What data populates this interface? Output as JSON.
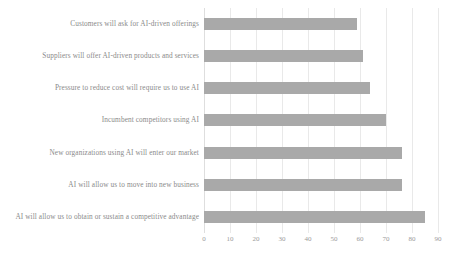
{
  "chart_data": {
    "type": "bar",
    "orientation": "horizontal",
    "title": "",
    "xlabel": "",
    "ylabel": "",
    "xlim": [
      0,
      90
    ],
    "grid": true,
    "legend": "none",
    "bar_color": "#a9a9a9",
    "background_color": "#ffffff",
    "xticks": [
      "0",
      "10",
      "20",
      "30",
      "40",
      "50",
      "60",
      "70",
      "80",
      "90"
    ],
    "xtick_values": [
      0,
      10,
      20,
      30,
      40,
      50,
      60,
      70,
      80,
      90
    ],
    "categories": [
      "Customers will ask for AI-driven offerings",
      "Suppliers will offer AI-driven products and services",
      "Pressure to reduce cost will require us to use AI",
      "Incumbent competitors using AI",
      "New organizations using AI will enter our market",
      "AI will allow us to move into new business",
      "AI will allow us to obtain or sustain a competitive advantage"
    ],
    "values": [
      59,
      61,
      64,
      70,
      76,
      76,
      85
    ]
  }
}
